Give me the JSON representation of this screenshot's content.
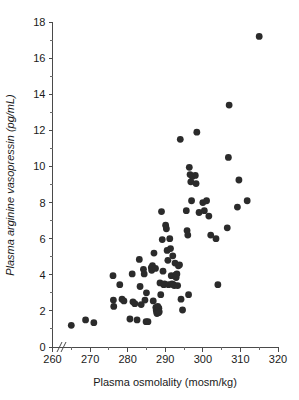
{
  "chart_data": {
    "type": "scatter",
    "title": "",
    "xlabel": "Plasma osmolality (mosm/kg)",
    "ylabel": "Plasma arginine vasopressin (pg/mL)",
    "xlim": [
      260,
      320
    ],
    "ylim": [
      0,
      18
    ],
    "x_major_ticks": [
      260,
      270,
      280,
      290,
      300,
      310,
      320
    ],
    "x_minor_ticks": [
      265,
      275,
      285,
      295,
      305,
      315
    ],
    "y_major_ticks": [
      0,
      2,
      4,
      6,
      8,
      10,
      12,
      14,
      16,
      18
    ],
    "y_minor_ticks": [
      1,
      3,
      5,
      7,
      9,
      11,
      13,
      15,
      17
    ],
    "x_tick_labels": [
      "260",
      "270",
      "280",
      "290",
      "300",
      "310",
      "320"
    ],
    "y_tick_labels": [
      "0",
      "2",
      "4",
      "6",
      "8",
      "10",
      "12",
      "14",
      "16",
      "18"
    ],
    "grid": false,
    "legend": false,
    "axis_break": "//",
    "axis_break_axis": "x",
    "marker": "filled-circle",
    "marker_color": "#2b2b2b",
    "marker_size": 3.4,
    "series": [
      {
        "name": "subjects",
        "points": [
          [
            265.0,
            1.2
          ],
          [
            268.8,
            1.5
          ],
          [
            271.0,
            1.35
          ],
          [
            276.1,
            3.95
          ],
          [
            276.2,
            2.6
          ],
          [
            276.3,
            2.25
          ],
          [
            277.9,
            3.45
          ],
          [
            278.5,
            2.65
          ],
          [
            279.0,
            2.55
          ],
          [
            280.6,
            1.55
          ],
          [
            281.2,
            4.05
          ],
          [
            281.4,
            2.5
          ],
          [
            281.9,
            2.4
          ],
          [
            282.5,
            1.5
          ],
          [
            283.1,
            4.85
          ],
          [
            283.3,
            3.35
          ],
          [
            283.6,
            2.35
          ],
          [
            284.2,
            4.3
          ],
          [
            284.4,
            4.05
          ],
          [
            284.6,
            2.6
          ],
          [
            284.9,
            1.4
          ],
          [
            285.0,
            3.0
          ],
          [
            285.4,
            1.4
          ],
          [
            286.3,
            4.4
          ],
          [
            286.4,
            4.25
          ],
          [
            286.6,
            4.5
          ],
          [
            286.8,
            2.55
          ],
          [
            287.0,
            5.2
          ],
          [
            287.4,
            4.35
          ],
          [
            287.5,
            2.2
          ],
          [
            287.6,
            2.05
          ],
          [
            287.7,
            1.95
          ],
          [
            287.8,
            1.85
          ],
          [
            288.0,
            2.25
          ],
          [
            288.1,
            2.0
          ],
          [
            288.2,
            1.9
          ],
          [
            288.3,
            2.15
          ],
          [
            288.4,
            1.95
          ],
          [
            288.6,
            3.55
          ],
          [
            288.8,
            2.9
          ],
          [
            289.0,
            7.5
          ],
          [
            289.2,
            5.95
          ],
          [
            289.4,
            4.2
          ],
          [
            289.6,
            3.45
          ],
          [
            289.8,
            3.5
          ],
          [
            290.1,
            6.75
          ],
          [
            290.3,
            6.55
          ],
          [
            290.5,
            5.35
          ],
          [
            290.7,
            4.8
          ],
          [
            290.9,
            3.45
          ],
          [
            291.2,
            6.0
          ],
          [
            291.4,
            5.45
          ],
          [
            291.6,
            3.95
          ],
          [
            291.8,
            3.5
          ],
          [
            292.0,
            5.05
          ],
          [
            292.2,
            3.45
          ],
          [
            292.4,
            3.4
          ],
          [
            292.6,
            4.65
          ],
          [
            292.8,
            4.0
          ],
          [
            292.9,
            3.85
          ],
          [
            293.1,
            4.05
          ],
          [
            293.3,
            3.4
          ],
          [
            293.5,
            4.5
          ],
          [
            293.8,
            4.55
          ],
          [
            294.0,
            11.5
          ],
          [
            294.2,
            2.65
          ],
          [
            294.6,
            2.05
          ],
          [
            295.6,
            7.55
          ],
          [
            295.8,
            6.45
          ],
          [
            296.0,
            6.2
          ],
          [
            296.2,
            2.9
          ],
          [
            296.4,
            9.95
          ],
          [
            296.6,
            9.55
          ],
          [
            296.8,
            9.15
          ],
          [
            297.0,
            8.1
          ],
          [
            297.2,
            9.45
          ],
          [
            298.0,
            9.5
          ],
          [
            298.2,
            9.05
          ],
          [
            298.4,
            11.9
          ],
          [
            299.0,
            7.45
          ],
          [
            300.0,
            8.0
          ],
          [
            300.4,
            7.55
          ],
          [
            301.0,
            8.1
          ],
          [
            301.6,
            7.25
          ],
          [
            302.1,
            6.2
          ],
          [
            303.5,
            6.0
          ],
          [
            304.0,
            3.45
          ],
          [
            306.5,
            6.6
          ],
          [
            306.8,
            10.5
          ],
          [
            307.0,
            13.4
          ],
          [
            309.2,
            7.75
          ],
          [
            309.6,
            9.25
          ],
          [
            311.8,
            8.1
          ],
          [
            315.0,
            17.2
          ]
        ]
      }
    ]
  },
  "axis": {
    "x_title": "Plasma osmolality (mosm/kg)",
    "y_title": "Plasma arginine vasopressin (pg/mL)"
  }
}
